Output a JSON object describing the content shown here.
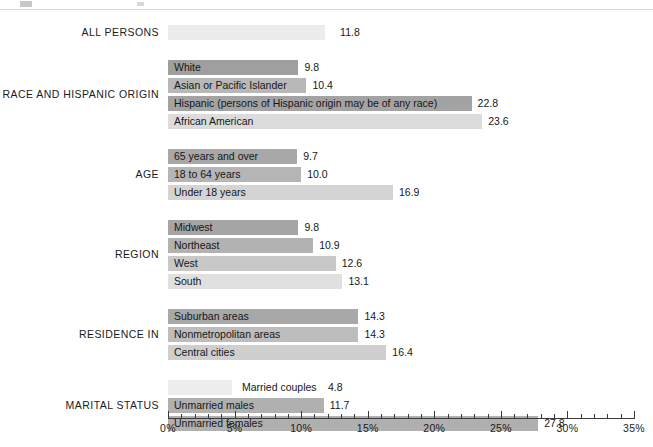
{
  "chart_data": {
    "type": "bar",
    "orientation": "horizontal",
    "title": "",
    "xlabel": "",
    "ylabel": "",
    "xlim": [
      0,
      35
    ],
    "xunit": "%",
    "grid": false,
    "legend": "none",
    "xticks": [
      "0%",
      "5%",
      "10%",
      "15%",
      "20%",
      "25%",
      "30%",
      "35%"
    ],
    "xtick_values": [
      0,
      5,
      10,
      15,
      20,
      25,
      30,
      35
    ],
    "minor_tick_step": 1,
    "categories": [
      "ALL PERSONS",
      "White",
      "Asian or Pacific Islander",
      "Hispanic (persons of Hispanic origin may be of any race)",
      "African American",
      "65 years and over",
      "18 to 64 years",
      "Under 18 years",
      "Midwest",
      "Northeast",
      "West",
      "South",
      "Suburban areas",
      "Nonmetropolitan areas",
      "Central cities",
      "Married couples",
      "Unmarried males",
      "Unmarried females"
    ],
    "values": [
      11.8,
      9.8,
      10.4,
      22.8,
      23.6,
      9.7,
      10.0,
      16.9,
      9.8,
      10.9,
      12.6,
      13.1,
      14.3,
      14.3,
      16.4,
      4.8,
      11.7,
      27.8
    ],
    "groups": [
      {
        "label": "ALL PERSONS",
        "bars": [
          {
            "label": "",
            "value": 11.8,
            "value_text": "11.8",
            "shade": "#ececec",
            "label_inside": false,
            "label_hidden": true
          }
        ]
      },
      {
        "label": "RACE AND HISPANIC ORIGIN",
        "bars": [
          {
            "label": "White",
            "value": 9.8,
            "value_text": "9.8",
            "shade": "#9f9f9f",
            "label_inside": true
          },
          {
            "label": "Asian or Pacific Islander",
            "value": 10.4,
            "value_text": "10.4",
            "shade": "#b8b8b8",
            "label_inside": true
          },
          {
            "label": "Hispanic (persons of Hispanic origin may be of any race)",
            "value": 22.8,
            "value_text": "22.8",
            "shade": "#a3a3a3",
            "label_inside": true
          },
          {
            "label": "African American",
            "value": 23.6,
            "value_text": "23.6",
            "shade": "#dcdcdc",
            "label_inside": true
          }
        ]
      },
      {
        "label": "AGE",
        "bars": [
          {
            "label": "65 years and over",
            "value": 9.7,
            "value_text": "9.7",
            "shade": "#a8a8a8",
            "label_inside": true
          },
          {
            "label": "18 to 64 years",
            "value": 10.0,
            "value_text": "10.0",
            "shade": "#b5b5b5",
            "label_inside": true
          },
          {
            "label": "Under 18 years",
            "value": 16.9,
            "value_text": "16.9",
            "shade": "#d4d4d4",
            "label_inside": true
          }
        ]
      },
      {
        "label": "REGION",
        "bars": [
          {
            "label": "Midwest",
            "value": 9.8,
            "value_text": "9.8",
            "shade": "#a5a5a5",
            "label_inside": true
          },
          {
            "label": "Northeast",
            "value": 10.9,
            "value_text": "10.9",
            "shade": "#b2b2b2",
            "label_inside": true
          },
          {
            "label": "West",
            "value": 12.6,
            "value_text": "12.6",
            "shade": "#c8c8c8",
            "label_inside": true
          },
          {
            "label": "South",
            "value": 13.1,
            "value_text": "13.1",
            "shade": "#e0e0e0",
            "label_inside": true
          }
        ]
      },
      {
        "label": "RESIDENCE IN",
        "bars": [
          {
            "label": "Suburban areas",
            "value": 14.3,
            "value_text": "14.3",
            "shade": "#a8a8a8",
            "label_inside": true
          },
          {
            "label": "Nonmetropolitan areas",
            "value": 14.3,
            "value_text": "14.3",
            "shade": "#bdbdbd",
            "label_inside": true
          },
          {
            "label": "Central cities",
            "value": 16.4,
            "value_text": "16.4",
            "shade": "#cfcfcf",
            "label_inside": true
          }
        ]
      },
      {
        "label": "MARITAL STATUS",
        "bars": [
          {
            "label": "Married couples",
            "value": 4.8,
            "value_text": "4.8",
            "shade": "#ededed",
            "label_inside": false
          },
          {
            "label": "Unmarried males",
            "value": 11.7,
            "value_text": "11.7",
            "shade": "#b0b0b0",
            "label_inside": true
          },
          {
            "label": "Unmarried females",
            "value": 27.8,
            "value_text": "27.8",
            "shade": "#b0b0b0",
            "label_inside": true
          }
        ]
      }
    ]
  }
}
